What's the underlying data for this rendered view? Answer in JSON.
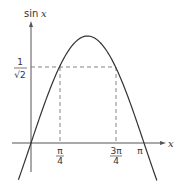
{
  "chart_data": {
    "type": "line",
    "title": "",
    "xlabel": "x",
    "ylabel": "sin x",
    "series": [
      {
        "name": "sin x",
        "function": "sin(x)",
        "x_range": [
          -0.35,
          3.5
        ]
      }
    ],
    "reference_lines": [
      {
        "type": "horizontal",
        "y": 0.7071,
        "label": "1/√2",
        "style": "dashed",
        "from_x": 0,
        "to_x": 2.3562
      },
      {
        "type": "vertical",
        "x": 0.7854,
        "label": "π/4",
        "style": "dashed",
        "from_y": 0,
        "to_y": 0.7071
      },
      {
        "type": "vertical",
        "x": 2.3562,
        "label": "3π/4",
        "style": "dashed",
        "from_y": 0,
        "to_y": 0.7071
      }
    ],
    "x_ticks": [
      {
        "value": 0.7854,
        "label_num": "π",
        "label_den": "4"
      },
      {
        "value": 2.3562,
        "label_num": "3π",
        "label_den": "4"
      },
      {
        "value": 3.1416,
        "label": "π"
      }
    ],
    "y_ticks": [
      {
        "value": 0.7071,
        "label_num": "1",
        "label_den": "√2"
      }
    ],
    "grid": false,
    "legend": null
  },
  "labels": {
    "y_axis": "sin x",
    "y_axis_sin": "sin",
    "y_axis_var": "x",
    "x_axis": "x",
    "y_tick_num": "1",
    "y_tick_den": "√2",
    "pi4_num": "π",
    "pi4_den": "4",
    "pi34_num": "3π",
    "pi34_den": "4",
    "pi": "π"
  },
  "colors": {
    "curve": "#333333",
    "axes": "#555555",
    "dashes": "#666666"
  }
}
